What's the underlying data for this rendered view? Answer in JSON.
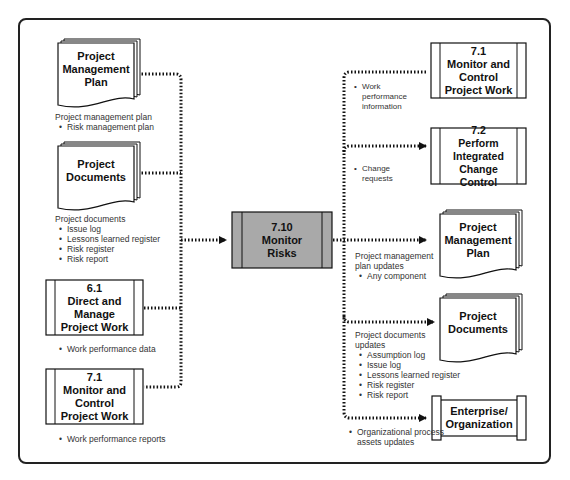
{
  "center": {
    "id": "7.10",
    "title": "7.10\nMonitor\nRisks"
  },
  "inputs": [
    {
      "title": "Project\nManagement\nPlan",
      "type": "document",
      "label_heading": "Project management plan",
      "label_items": [
        "Risk management plan"
      ]
    },
    {
      "title": "Project\nDocuments",
      "type": "document",
      "label_heading": "Project documents",
      "label_items": [
        "Issue log",
        "Lessons learned register",
        "Risk register",
        "Risk report"
      ]
    },
    {
      "title": "6.1\nDirect and\nManage\nProject Work",
      "type": "process",
      "label_heading": "",
      "label_items": [
        "Work performance data"
      ]
    },
    {
      "title": "7.1\nMonitor and\nControl\nProject Work",
      "type": "process",
      "label_heading": "",
      "label_items": [
        "Work performance reports"
      ]
    }
  ],
  "outputs": [
    {
      "title": "7.1\nMonitor and\nControl\nProject Work",
      "type": "process",
      "label_heading": "",
      "label_items": [
        "Work\nperformance\ninformation"
      ]
    },
    {
      "title": "7.2\nPerform\nIntegrated\nChange Control",
      "type": "process",
      "label_heading": "",
      "label_items": [
        "Change\nrequests"
      ]
    },
    {
      "title": "Project\nManagement\nPlan",
      "type": "document",
      "label_heading": "Project management\nplan updates",
      "label_items": [
        "Any component"
      ]
    },
    {
      "title": "Project\nDocuments",
      "type": "document",
      "label_heading": "Project documents\nupdates",
      "label_items": [
        "Assumption log",
        "Issue log",
        "Lessons learned register",
        "Risk register",
        "Risk report"
      ]
    },
    {
      "title": "Enterprise/\nOrganization",
      "type": "enterprise",
      "label_heading": "",
      "label_items": [
        "Organizational process\nassets updates"
      ]
    }
  ],
  "colors": {
    "center_fill": "#a9a9a9",
    "line": "#111111",
    "frame": "#222222"
  }
}
